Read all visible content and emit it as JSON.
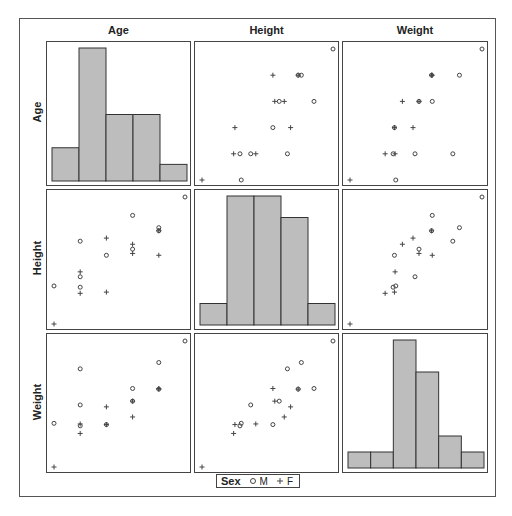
{
  "chart_data": {
    "type": "scatter-matrix",
    "title": "",
    "variables": [
      "Age",
      "Height",
      "Weight"
    ],
    "group_variable": "Sex",
    "legend": {
      "title": "Sex",
      "entries": [
        {
          "label": "M",
          "marker": "circle"
        },
        {
          "label": "F",
          "marker": "plus"
        }
      ],
      "position": "bottom"
    },
    "ranges": {
      "Age": [
        11,
        16
      ],
      "Height": [
        51.3,
        72
      ],
      "Weight": [
        50.5,
        150
      ]
    },
    "histograms": {
      "Age": {
        "bins": 5,
        "counts": [
          2,
          8,
          4,
          4,
          1
        ]
      },
      "Height": {
        "bins": 5,
        "counts": [
          1,
          6,
          6,
          5,
          1
        ]
      },
      "Weight": {
        "bins": 6,
        "counts": [
          1,
          1,
          8,
          6,
          2,
          1
        ]
      }
    },
    "points": [
      {
        "sex": "M",
        "age": 14,
        "height": 69.0,
        "weight": 112.5
      },
      {
        "sex": "F",
        "age": 13,
        "height": 56.5,
        "weight": 84.0
      },
      {
        "sex": "F",
        "age": 13,
        "height": 65.3,
        "weight": 98.0
      },
      {
        "sex": "F",
        "age": 14,
        "height": 62.8,
        "weight": 102.5
      },
      {
        "sex": "M",
        "age": 14,
        "height": 63.5,
        "weight": 102.5
      },
      {
        "sex": "M",
        "age": 12,
        "height": 57.3,
        "weight": 83.0
      },
      {
        "sex": "F",
        "age": 12,
        "height": 59.8,
        "weight": 84.5
      },
      {
        "sex": "F",
        "age": 15,
        "height": 62.5,
        "weight": 112.5
      },
      {
        "sex": "M",
        "age": 13,
        "height": 62.5,
        "weight": 84.0
      },
      {
        "sex": "M",
        "age": 12,
        "height": 59.0,
        "weight": 99.5
      },
      {
        "sex": "F",
        "age": 11,
        "height": 51.3,
        "weight": 50.5
      },
      {
        "sex": "F",
        "age": 14,
        "height": 64.3,
        "weight": 90.0
      },
      {
        "sex": "F",
        "age": 12,
        "height": 56.3,
        "weight": 77.0
      },
      {
        "sex": "F",
        "age": 15,
        "height": 66.5,
        "weight": 112.0
      },
      {
        "sex": "M",
        "age": 16,
        "height": 72.0,
        "weight": 150.0
      },
      {
        "sex": "M",
        "age": 12,
        "height": 64.8,
        "weight": 128.0
      },
      {
        "sex": "M",
        "age": 15,
        "height": 67.0,
        "weight": 133.0
      },
      {
        "sex": "M",
        "age": 11,
        "height": 57.5,
        "weight": 85.0
      },
      {
        "sex": "M",
        "age": 15,
        "height": 66.5,
        "weight": 112.0
      }
    ],
    "grid": false,
    "colors": {
      "bar_fill": "#bdbdbd",
      "bar_edge": "#333333",
      "marker": "#444444",
      "frame": "#444444"
    }
  },
  "labels": {
    "columns": [
      "Age",
      "Height",
      "Weight"
    ],
    "rows": [
      "Age",
      "Height",
      "Weight"
    ],
    "legend_title": "Sex",
    "legend_m": "M",
    "legend_f": "F"
  }
}
